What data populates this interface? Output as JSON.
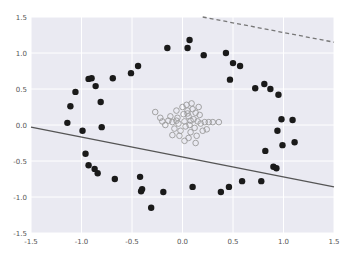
{
  "chart_data": {
    "type": "scatter",
    "title": "",
    "xlabel": "",
    "ylabel": "",
    "xlim": [
      -1.5,
      1.5
    ],
    "ylim": [
      -1.5,
      1.5
    ],
    "grid": true,
    "legend": null,
    "x_ticks": [
      "-1.5",
      "-1.0",
      "-0.5",
      "0.0",
      "0.5",
      "1.0",
      "1.5"
    ],
    "y_ticks": [
      "1.5",
      "1.0",
      "0.5",
      "0.0",
      "-0.5",
      "-1.0",
      "-1.5"
    ],
    "x_tick_values": [
      -1.5,
      -1.0,
      -0.5,
      0.0,
      0.5,
      1.0,
      1.5
    ],
    "y_tick_values": [
      1.5,
      1.0,
      0.5,
      0.0,
      -0.5,
      -1.0,
      -1.5
    ],
    "series": [
      {
        "name": "outer ring (class 0)",
        "marker": "filled-circle",
        "color": "#1a1a1a",
        "points": [
          [
            -0.93,
            0.64
          ],
          [
            -0.9,
            0.65
          ],
          [
            -0.86,
            0.54
          ],
          [
            -1.06,
            0.46
          ],
          [
            -0.81,
            0.32
          ],
          [
            -1.11,
            0.26
          ],
          [
            -1.14,
            0.03
          ],
          [
            -0.8,
            -0.03
          ],
          [
            -0.99,
            -0.08
          ],
          [
            -0.69,
            0.65
          ],
          [
            -0.51,
            0.72
          ],
          [
            -0.44,
            0.82
          ],
          [
            -0.15,
            1.07
          ],
          [
            0.07,
            1.18
          ],
          [
            0.05,
            1.07
          ],
          [
            0.21,
            0.97
          ],
          [
            0.43,
            1.0
          ],
          [
            0.5,
            0.86
          ],
          [
            0.57,
            0.82
          ],
          [
            0.47,
            0.63
          ],
          [
            0.72,
            0.51
          ],
          [
            0.81,
            0.57
          ],
          [
            0.87,
            0.5
          ],
          [
            0.95,
            0.42
          ],
          [
            0.98,
            0.08
          ],
          [
            1.09,
            0.07
          ],
          [
            0.94,
            -0.08
          ],
          [
            0.99,
            -0.28
          ],
          [
            1.11,
            -0.24
          ],
          [
            0.82,
            -0.36
          ],
          [
            0.9,
            -0.58
          ],
          [
            0.93,
            -0.6
          ],
          [
            0.1,
            -0.86
          ],
          [
            0.38,
            -0.93
          ],
          [
            0.46,
            -0.86
          ],
          [
            0.59,
            -0.78
          ],
          [
            0.78,
            -0.78
          ],
          [
            -0.96,
            -0.4
          ],
          [
            -0.93,
            -0.56
          ],
          [
            -0.87,
            -0.61
          ],
          [
            -0.84,
            -0.67
          ],
          [
            -0.67,
            -0.75
          ],
          [
            -0.42,
            -0.72
          ],
          [
            -0.41,
            -0.92
          ],
          [
            -0.4,
            -0.89
          ],
          [
            -0.19,
            -0.93
          ],
          [
            -0.31,
            -1.15
          ]
        ]
      },
      {
        "name": "inner cluster (class 1)",
        "marker": "open-circle",
        "color": "#999999",
        "points": [
          [
            -0.27,
            0.18
          ],
          [
            -0.22,
            0.1
          ],
          [
            -0.2,
            0.05
          ],
          [
            -0.17,
            0.0
          ],
          [
            -0.12,
            0.12
          ],
          [
            -0.1,
            0.04
          ],
          [
            -0.08,
            -0.05
          ],
          [
            -0.06,
            0.2
          ],
          [
            -0.05,
            0.1
          ],
          [
            -0.04,
            0.02
          ],
          [
            -0.02,
            -0.08
          ],
          [
            0.0,
            0.25
          ],
          [
            0.01,
            0.15
          ],
          [
            0.02,
            0.05
          ],
          [
            0.03,
            -0.02
          ],
          [
            0.04,
            0.28
          ],
          [
            0.05,
            0.2
          ],
          [
            0.06,
            0.12
          ],
          [
            0.07,
            0.0
          ],
          [
            0.08,
            -0.1
          ],
          [
            0.09,
            0.3
          ],
          [
            0.1,
            0.22
          ],
          [
            0.11,
            0.08
          ],
          [
            0.12,
            -0.04
          ],
          [
            0.13,
            0.17
          ],
          [
            0.14,
            -0.15
          ],
          [
            0.15,
            0.05
          ],
          [
            0.16,
            0.25
          ],
          [
            0.18,
            0.02
          ],
          [
            0.2,
            -0.08
          ],
          [
            0.22,
            0.04
          ],
          [
            0.26,
            0.04
          ],
          [
            0.3,
            0.04
          ],
          [
            0.24,
            -0.06
          ],
          [
            0.06,
            -0.18
          ],
          [
            -0.03,
            -0.15
          ],
          [
            -0.1,
            -0.14
          ],
          [
            0.02,
            -0.22
          ],
          [
            0.13,
            -0.25
          ],
          [
            -0.14,
            0.06
          ],
          [
            0.05,
            0.16
          ],
          [
            0.08,
            0.06
          ],
          [
            0.17,
            0.14
          ],
          [
            -0.06,
            0.06
          ],
          [
            0.36,
            0.04
          ]
        ]
      }
    ],
    "lines": [
      {
        "name": "solid decision line",
        "style": "solid",
        "color": "#555555",
        "from": [
          -1.5,
          -0.03
        ],
        "to": [
          1.5,
          -0.86
        ]
      },
      {
        "name": "dashed line",
        "style": "dashed",
        "color": "#777777",
        "from": [
          0.2,
          1.5
        ],
        "to": [
          1.5,
          1.15
        ]
      }
    ]
  },
  "style": {
    "plot_bg": "#eaeaf2",
    "grid_color": "#ffffff",
    "filled_marker": "#1a1a1a",
    "open_marker": "#9a9a9a"
  }
}
